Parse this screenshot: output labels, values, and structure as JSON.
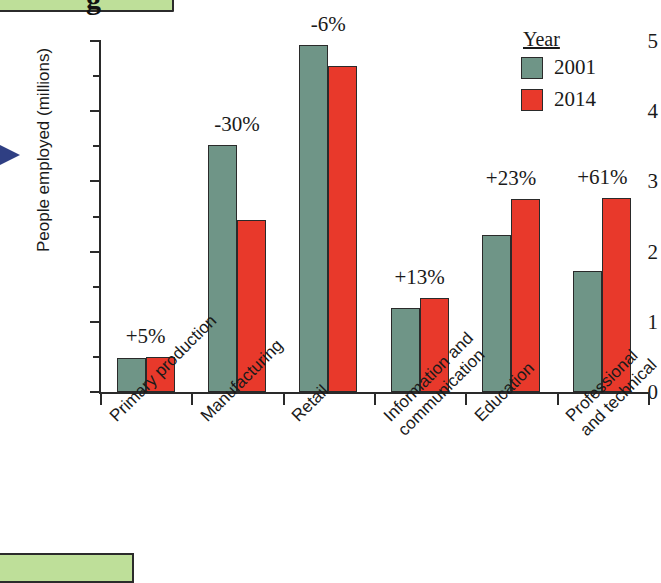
{
  "decor": {
    "top_box_glyph": "g",
    "arrow_name": "blue-right-arrow"
  },
  "legend": {
    "title": "Year",
    "entries": [
      {
        "label": "2001",
        "color": "#6f9587"
      },
      {
        "label": "2014",
        "color": "#e8392b"
      }
    ]
  },
  "chart_data": {
    "type": "bar",
    "title": "",
    "xlabel": "",
    "ylabel": "People employed (millions)",
    "ylim": [
      0,
      5
    ],
    "yticks": [
      0,
      1,
      2,
      3,
      4,
      5
    ],
    "ytick_labels": [
      "0",
      "1",
      "2",
      "3",
      "4",
      "5"
    ],
    "minor_tick_step": 0.5,
    "grid": false,
    "legend_position": "top-right",
    "categories": [
      "Primary production",
      "Manufacturing",
      "Retail",
      "Information and\ncommunication",
      "Education",
      "Professional\nand technical"
    ],
    "category_labels": [
      [
        "Primary production"
      ],
      [
        "Manufacturing"
      ],
      [
        "Retail"
      ],
      [
        "Information and",
        "communication"
      ],
      [
        "Education"
      ],
      [
        "Professional",
        "and technical"
      ]
    ],
    "series": [
      {
        "name": "2001",
        "color": "#6f9587",
        "values": [
          0.48,
          3.52,
          4.94,
          1.19,
          2.24,
          1.73
        ]
      },
      {
        "name": "2014",
        "color": "#e8392b",
        "values": [
          0.5,
          2.45,
          4.64,
          1.34,
          2.75,
          2.77
        ]
      }
    ],
    "annotations": [
      "+5%",
      "-30%",
      "-6%",
      "+13%",
      "+23%",
      "+61%"
    ]
  }
}
